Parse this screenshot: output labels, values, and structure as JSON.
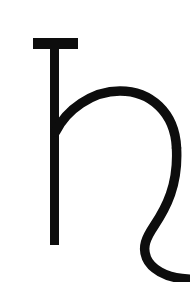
{
  "image": {
    "width": 190,
    "height": 282,
    "background_color": "#ffffff",
    "description": "Single large black glyph on a plain white field"
  },
  "glyph": {
    "name": "saturn-symbol",
    "character": "♄",
    "label": "Saturn",
    "alt_label": "h with crossbar",
    "stroke_color": "#0d0d0d",
    "fill_color": "#0d0d0d",
    "stroke_width": 9,
    "parts": {
      "crossbar": {
        "name": "top-crossbar",
        "x": 33,
        "y": 38,
        "width": 45,
        "height": 11
      },
      "stem": {
        "name": "vertical-stem",
        "x": 50,
        "y": 38,
        "width": 9,
        "height": 207,
        "top": 38,
        "bottom": 245
      },
      "shoulder": {
        "name": "shoulder-arc",
        "start_x": 55,
        "start_y": 131,
        "apex_x": 124,
        "apex_y": 92,
        "end_x": 176,
        "end_y": 150
      },
      "tail": {
        "name": "descender-tail",
        "start_x": 176,
        "start_y": 150,
        "waist_x": 146,
        "waist_y": 243,
        "end_x": 190,
        "end_y": 276
      }
    }
  }
}
